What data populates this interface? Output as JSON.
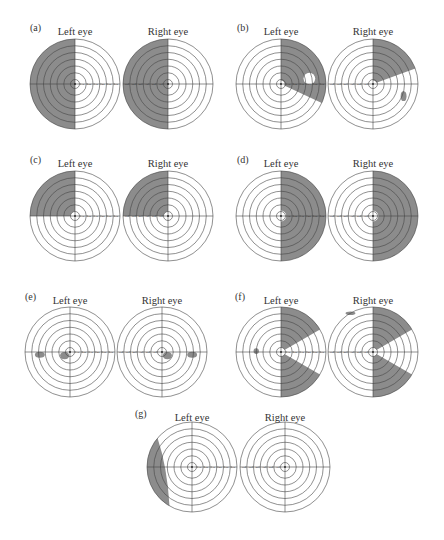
{
  "figure": {
    "colors": {
      "defect": "#8c8c8c",
      "line": "#444444",
      "background": "#ffffff",
      "text": "#333333"
    },
    "tick_labels": [
      "10",
      "20",
      "30",
      "40",
      "50",
      "60"
    ],
    "eye_labels": {
      "left": "Left eye",
      "right": "Right eye"
    },
    "panels": [
      {
        "id": "a",
        "label": "(a)",
        "label_pos": [
          30,
          31
        ],
        "title_y": 35,
        "cy": 84,
        "description": "Left homonymous hemianopia (left half of each eye's field lost)",
        "eyes": [
          {
            "side": "left",
            "title": "Left eye",
            "cx": 75,
            "defects": [
              {
                "type": "sector",
                "from": 90,
                "to": 270,
                "r0": 0,
                "r1": 1
              }
            ]
          },
          {
            "side": "right",
            "title": "Right eye",
            "cx": 168,
            "defects": [
              {
                "type": "sector",
                "from": 90,
                "to": 270,
                "r0": 0,
                "r1": 1
              }
            ]
          }
        ]
      },
      {
        "id": "b",
        "label": "(b)",
        "label_pos": [
          237,
          31
        ],
        "title_y": 35,
        "cy": 84,
        "description": "Right upper quadrantic defects with sparing wedge",
        "eyes": [
          {
            "side": "left",
            "title": "Left eye",
            "cx": 281,
            "defects": [
              {
                "type": "sector",
                "from": -25,
                "to": 90,
                "r0": 0.08,
                "r1": 1
              },
              {
                "type": "hole",
                "x": 0.63,
                "y": 0.12,
                "r": 0.13
              }
            ]
          },
          {
            "side": "right",
            "title": "Right eye",
            "cx": 373,
            "defects": [
              {
                "type": "sector",
                "from": 20,
                "to": 90,
                "r0": 0.08,
                "r1": 1
              },
              {
                "type": "blob",
                "x": 0.68,
                "y": -0.27,
                "w": 0.13,
                "h": 0.22
              }
            ]
          }
        ]
      },
      {
        "id": "c",
        "label": "(c)",
        "label_pos": [
          30,
          163
        ],
        "title_y": 167,
        "cy": 216,
        "description": "Left upper homonymous quadrantanopia",
        "eyes": [
          {
            "side": "left",
            "title": "Left eye",
            "cx": 75,
            "defects": [
              {
                "type": "sector",
                "from": 90,
                "to": 180,
                "r0": 0.1,
                "r1": 1
              }
            ]
          },
          {
            "side": "right",
            "title": "Right eye",
            "cx": 168,
            "defects": [
              {
                "type": "sector",
                "from": 90,
                "to": 180,
                "r0": 0.1,
                "r1": 1
              }
            ]
          }
        ]
      },
      {
        "id": "d",
        "label": "(d)",
        "label_pos": [
          237,
          163
        ],
        "title_y": 167,
        "cy": 216,
        "description": "Right homonymous hemianopia with macular sparing",
        "eyes": [
          {
            "side": "left",
            "title": "Left eye",
            "cx": 281,
            "defects": [
              {
                "type": "sector",
                "from": -90,
                "to": 90,
                "r0": 0.12,
                "r1": 1
              }
            ]
          },
          {
            "side": "right",
            "title": "Right eye",
            "cx": 373,
            "defects": [
              {
                "type": "sector",
                "from": -90,
                "to": 90,
                "r0": 0.12,
                "r1": 1
              }
            ]
          }
        ]
      },
      {
        "id": "e",
        "label": "(e)",
        "label_pos": [
          25,
          300
        ],
        "title_y": 304,
        "cy": 352,
        "description": "Bilateral small scotomas near fixation and in mid-periphery",
        "eyes": [
          {
            "side": "left",
            "title": "Left eye",
            "cx": 70,
            "defects": [
              {
                "type": "blob",
                "x": -0.67,
                "y": -0.06,
                "w": 0.22,
                "h": 0.13
              },
              {
                "type": "blob",
                "x": -0.12,
                "y": -0.08,
                "w": 0.2,
                "h": 0.16
              }
            ]
          },
          {
            "side": "right",
            "title": "Right eye",
            "cx": 162,
            "defects": [
              {
                "type": "blob",
                "x": 0.12,
                "y": -0.08,
                "w": 0.2,
                "h": 0.16
              },
              {
                "type": "blob",
                "x": 0.67,
                "y": -0.06,
                "w": 0.22,
                "h": 0.13
              }
            ]
          }
        ]
      },
      {
        "id": "f",
        "label": "(f)",
        "label_pos": [
          235,
          300
        ],
        "title_y": 304,
        "cy": 352,
        "description": "Right homonymous hemianopia with spared horizontal wedge",
        "eyes": [
          {
            "side": "left",
            "title": "Left eye",
            "cx": 281,
            "defects": [
              {
                "type": "sector",
                "from": 30,
                "to": 90,
                "r0": 0.1,
                "r1": 1
              },
              {
                "type": "sector",
                "from": -90,
                "to": -30,
                "r0": 0.1,
                "r1": 1
              },
              {
                "type": "blob",
                "x": -0.55,
                "y": 0.02,
                "w": 0.12,
                "h": 0.13
              }
            ]
          },
          {
            "side": "right",
            "title": "Right eye",
            "cx": 373,
            "defects": [
              {
                "type": "sector",
                "from": 30,
                "to": 90,
                "r0": 0.1,
                "r1": 1
              },
              {
                "type": "sector",
                "from": -90,
                "to": -30,
                "r0": 0.1,
                "r1": 1
              },
              {
                "type": "blob",
                "x": -0.5,
                "y": 0.86,
                "w": 0.22,
                "h": 0.08
              }
            ]
          }
        ]
      },
      {
        "id": "g",
        "label": "(g)",
        "label_pos": [
          135,
          417
        ],
        "title_y": 421,
        "cy": 467,
        "description": "Temporal crescent defect in left eye only",
        "eyes": [
          {
            "side": "left",
            "title": "Left eye",
            "cx": 192,
            "defects": [
              {
                "type": "crescent",
                "from": 140,
                "to": 240
              }
            ]
          },
          {
            "side": "right",
            "title": "Right eye",
            "cx": 285,
            "defects": []
          }
        ]
      }
    ],
    "ring_count": 7,
    "radius": 45
  }
}
